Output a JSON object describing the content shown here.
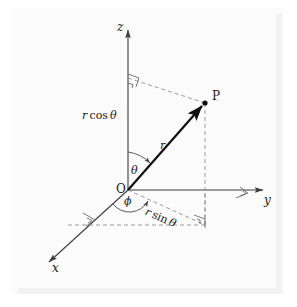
{
  "figure": {
    "background_color": "#fdfdfd",
    "plate_color": "#fbfbfb",
    "line_color": "#3c3c3c",
    "dash_color": "#8c8c8c",
    "vector_color": "#111111",
    "labels": {
      "z_axis": "z",
      "y_axis": "y",
      "x_axis": "x",
      "origin": "O",
      "point": "P",
      "radius": "r",
      "polar_angle": "θ",
      "azimuth_angle": "ϕ",
      "height_expr_r": "r",
      "height_expr_fn": "cos",
      "height_expr_angle": "θ",
      "projection_expr_r": "r",
      "projection_expr_fn": "sin",
      "projection_expr_angle": "θ",
      "height_full": "r cos θ",
      "projection_full": "r sin θ"
    },
    "geometry": {
      "origin": [
        128,
        190
      ],
      "point_p": [
        205,
        103
      ],
      "z_axis_tip": [
        128,
        25
      ],
      "y_axis_tip": [
        268,
        190
      ],
      "x_axis_tip": [
        45,
        266
      ],
      "p_foot_xy": [
        205,
        225
      ],
      "z_foot": [
        128,
        78
      ],
      "y_intercept": [
        205,
        190
      ]
    }
  }
}
